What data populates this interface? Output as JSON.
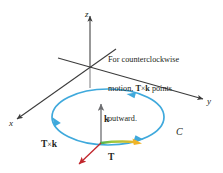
{
  "figure": {
    "background_color": "#ffffff",
    "caption": {
      "line1": "For counterclockwise",
      "line2_pre": "motion, ",
      "line2_vec1": "T",
      "line2_times": "×",
      "line2_vec2": "k",
      "line2_post": " points",
      "line3": "outward."
    },
    "axes": {
      "x_label": "x",
      "y_label": "y",
      "z_label": "z",
      "color": "#3b3b3b"
    },
    "curve": {
      "label": "C",
      "color": "#3fa9dc",
      "direction": "counterclockwise"
    },
    "vectors": [
      {
        "name": "k",
        "label": "k",
        "color": "#6d6e71",
        "direction": "up"
      },
      {
        "name": "T-cross-k",
        "label_part1": "T",
        "label_times": "×",
        "label_part2": "k",
        "color": "#c1272d",
        "direction": "outward-down-left"
      },
      {
        "name": "T",
        "label": "T",
        "color": "#f0b429",
        "direction": "tangent-right"
      }
    ],
    "colors": {
      "curve_blue": "#3fa9dc",
      "vector_red": "#c1272d",
      "vector_yellow": "#f0b429",
      "vector_gray": "#6d6e71",
      "axis_gray": "#3b3b3b",
      "text_black": "#231f20"
    }
  }
}
